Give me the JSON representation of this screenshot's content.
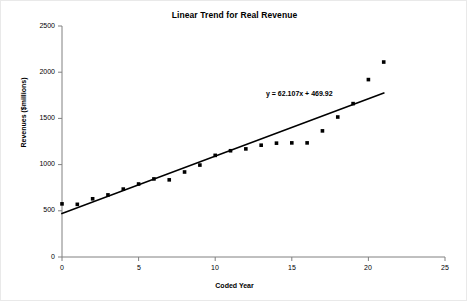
{
  "chart_data": {
    "type": "scatter",
    "title": "Linear Trend for Real Revenue",
    "xlabel": "Coded Year",
    "ylabel": "Revenues ($millions)",
    "xlim": [
      0,
      25
    ],
    "ylim": [
      0,
      2500
    ],
    "xticks": [
      0,
      5,
      10,
      15,
      20,
      25
    ],
    "yticks": [
      0,
      500,
      1000,
      1500,
      2000,
      2500
    ],
    "xtick_labels": [
      "0",
      "5",
      "10",
      "15",
      "20",
      "25"
    ],
    "ytick_labels": [
      "0",
      "500",
      "1000",
      "1500",
      "2000",
      "2500"
    ],
    "grid": false,
    "legend": false,
    "marker_color": "#000000",
    "line_color": "#000000",
    "series": [
      {
        "name": "Real Revenue",
        "type": "scatter",
        "x": [
          0,
          1,
          2,
          3,
          4,
          5,
          6,
          7,
          8,
          9,
          10,
          11,
          12,
          13,
          14,
          15,
          16,
          17,
          18,
          19,
          20,
          21
        ],
        "values": [
          575,
          570,
          630,
          672,
          735,
          790,
          845,
          835,
          920,
          995,
          1100,
          1150,
          1170,
          1210,
          1232,
          1235,
          1235,
          1365,
          1515,
          1660,
          1920,
          2110
        ]
      },
      {
        "name": "Linear trend",
        "type": "line",
        "equation": "y = 62.107x + 469.92",
        "slope": 62.107,
        "intercept": 469.92,
        "x_start": 0,
        "x_end": 21
      }
    ],
    "annotations": [
      {
        "text": "y = 62.107x + 469.92",
        "x": 13.4,
        "y": 1765
      }
    ]
  },
  "plot_geometry": {
    "left": 61,
    "right": 444,
    "top": 25,
    "bottom": 256
  }
}
